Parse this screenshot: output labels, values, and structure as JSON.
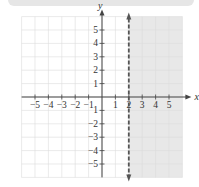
{
  "chart_data": {
    "type": "inequality-graph",
    "title": "",
    "xlabel": "x",
    "ylabel": "y",
    "xlim": [
      -6,
      6
    ],
    "ylim": [
      -6,
      6
    ],
    "x_ticks": [
      "-5",
      "-4",
      "-3",
      "-2",
      "-1",
      "1",
      "2",
      "3",
      "4",
      "5"
    ],
    "y_ticks": [
      "5",
      "4",
      "3",
      "2",
      "1",
      "-1",
      "-2",
      "-3",
      "-4",
      "-5"
    ],
    "grid": true,
    "boundary": {
      "type": "vertical",
      "x": 2,
      "style": "dashed"
    },
    "shaded_region": "x > 2",
    "colors": {
      "shade": "#e8e8e8",
      "grid": "#dcdcdc",
      "axis": "#444444",
      "boundary": "#555555"
    }
  }
}
